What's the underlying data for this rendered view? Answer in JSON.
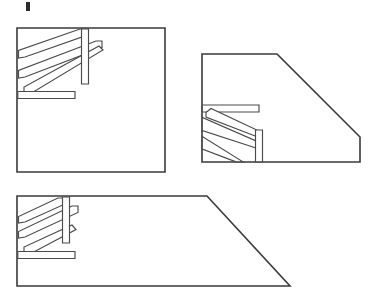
{
  "document": {
    "title": "Stair Railing Elevation Views",
    "type": "line-drawing",
    "stroke_color": "#3a3a3a",
    "detail_stroke_color": "#4a4a4a",
    "background_color": "#ffffff",
    "canvas": {
      "width": 378,
      "height": 297
    }
  },
  "marks": {
    "top_tick": {
      "label": "registration tick",
      "x": 26,
      "y": 2,
      "width": 4,
      "height": 9
    }
  },
  "figures": [
    {
      "id": "figure-1",
      "name": "square-wall-elevation",
      "label": "Square wall elevation with ascending handrail",
      "outline_type": "square",
      "outline_points": "17,28 165,28 165,172 17,172 17,28",
      "railing": {
        "direction": "ascending-right",
        "handrail_upper": "19,58 19,50 80,29 86,29 86,35 26,57",
        "handrail_lower": "19,76 19,68 93,42 99,42 99,48 26,75",
        "landing_rail": "18,92 75,92 75,99 18,99 18,92",
        "newel_post": "82,29 89,29 89,84 82,84 82,29",
        "stringer": "20,94 78,70",
        "mid_diagonal": "26,91 95,67"
      }
    },
    {
      "id": "figure-2",
      "name": "chamfered-wall-elevation",
      "label": "Chamfered wall elevation, mirrored handrail",
      "outline_type": "chamfered-right",
      "outline_points": "202,54 277,54 360,137 360,162 202,162 202,54",
      "railing": {
        "direction": "descending-right",
        "handrail_upper": "203,105 259,105 259,112 203,112",
        "handrail_lower": "203,123 203,131 257,150 257,143",
        "newel_post": "256,131 263,131 263,162 256,162 256,131",
        "stringer": "204,113 256,132",
        "mid_diagonal": "204,131 255,149",
        "lower_diagonal": "203,150 240,162"
      }
    },
    {
      "id": "figure-3",
      "name": "trapezoid-wall-elevation",
      "label": "Trapezoidal wall elevation with ascending handrail",
      "outline_type": "trapezoid",
      "outline_points": "17,196 207,196 290,286 17,286 17,196",
      "railing": {
        "direction": "ascending-right",
        "handrail_upper": "19,222 19,215 58,198 64,198 64,204 26,221",
        "handrail_lower": "19,236 19,229 72,206 78,206 78,212 26,235",
        "landing_rail": "18,252 75,252 75,259 18,259 18,252",
        "newel_post": "63,197 70,197 70,243 63,243 63,197",
        "stringer": "20,254 66,235",
        "mid_diagonal": "26,251 74,231"
      }
    }
  ]
}
